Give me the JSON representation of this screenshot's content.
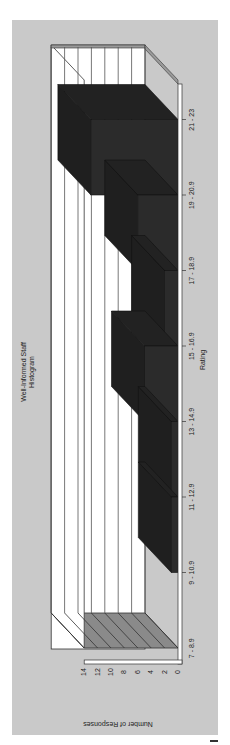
{
  "chart_data": {
    "type": "bar",
    "style": "3d-histogram",
    "orientation_note": "image rotated 90 degrees clockwise",
    "title": "Well-Informed Staff",
    "subtitle": "Histogram",
    "xlabel": "Rating",
    "ylabel": "Number of Responses",
    "categories": [
      "7 - 8.9",
      "9 - 10.9",
      "11 - 12.9",
      "13 - 14.9",
      "15 - 16.9",
      "17 - 18.9",
      "19 - 20.9",
      "21 - 23"
    ],
    "values": [
      0,
      1,
      1,
      5,
      2,
      6,
      13,
      0
    ],
    "yticks": [
      0,
      2,
      4,
      6,
      8,
      10,
      12,
      14
    ],
    "ylim": [
      0,
      14
    ],
    "grid": true,
    "legend": false,
    "colors": {
      "bar_front": "#2b2b2b",
      "bar_top": "#1f1f1f",
      "bar_side": "#222222",
      "panel": "#c9c9c9",
      "wall": "#ffffff",
      "floor": "#8a8a8a"
    }
  }
}
